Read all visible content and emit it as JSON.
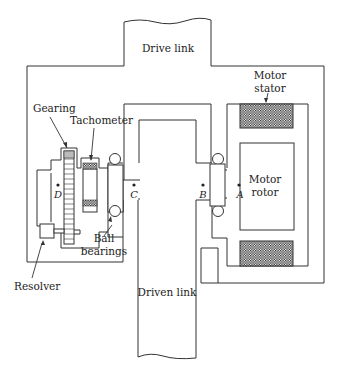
{
  "diagram": {
    "type": "mechanical-cross-section",
    "labels": {
      "drive_link": "Drive link",
      "driven_link": "Driven link",
      "motor_stator": [
        "Motor",
        "stator"
      ],
      "motor_rotor": [
        "Motor",
        "rotor"
      ],
      "gearing": "Gearing",
      "tachometer": "Tachometer",
      "ball_bearings": [
        "Ball",
        "bearings"
      ],
      "resolver": "Resolver"
    },
    "points": {
      "A": "A",
      "B": "B",
      "C": "C",
      "D": "D"
    },
    "colors": {
      "line": "#333333",
      "hatch": "#2a2a2a",
      "background": "#ffffff"
    }
  }
}
